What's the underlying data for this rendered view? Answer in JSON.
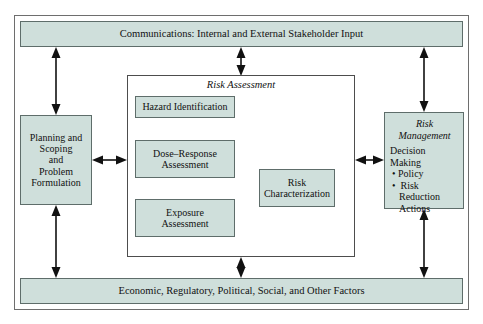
{
  "diagram": {
    "colors": {
      "box_fill": "#cfdfdb",
      "box_border": "#5e6d6a",
      "frame_border": "#4d4d4d",
      "arrow": "#111111",
      "background": "#ffffff"
    }
  },
  "communications": {
    "label": "Communications: Internal and External Stakeholder Input"
  },
  "economic": {
    "label": "Economic, Regulatory, Political, Social, and Other Factors"
  },
  "planning": {
    "line1": "Planning and",
    "line2": "Scoping",
    "line3": "and",
    "line4": "Problem",
    "line5": "Formulation"
  },
  "risk_assessment": {
    "title": "Risk Assessment",
    "hazard": {
      "label": "Hazard Identification"
    },
    "dose_response": {
      "line1": "Dose–Response",
      "line2": "Assessment"
    },
    "exposure": {
      "line1": "Exposure",
      "line2": "Assessment"
    },
    "characterization": {
      "line1": "Risk",
      "line2": "Characterization"
    }
  },
  "risk_management": {
    "title_line1": "Risk",
    "title_line2": "Management",
    "heading": "Decision Making",
    "bullets": [
      "Policy",
      "Risk Reduction",
      "Actions"
    ]
  },
  "arrows": [
    {
      "name": "communications-to-planning",
      "type": "double-headed-vertical"
    },
    {
      "name": "communications-to-risk-assessment",
      "type": "double-headed-vertical"
    },
    {
      "name": "communications-to-risk-management",
      "type": "double-headed-vertical"
    },
    {
      "name": "planning-to-risk-assessment",
      "type": "double-headed-horizontal"
    },
    {
      "name": "risk-assessment-to-risk-management",
      "type": "double-headed-horizontal"
    },
    {
      "name": "hazard-to-dose-response",
      "type": "single-headed-down"
    },
    {
      "name": "dose-response-to-exposure",
      "type": "double-headed-vertical"
    },
    {
      "name": "assessment-to-characterization",
      "type": "single-headed-right"
    },
    {
      "name": "planning-to-economic",
      "type": "double-headed-vertical"
    },
    {
      "name": "risk-assessment-to-economic",
      "type": "double-headed-vertical"
    },
    {
      "name": "risk-management-to-economic",
      "type": "double-headed-vertical"
    }
  ]
}
